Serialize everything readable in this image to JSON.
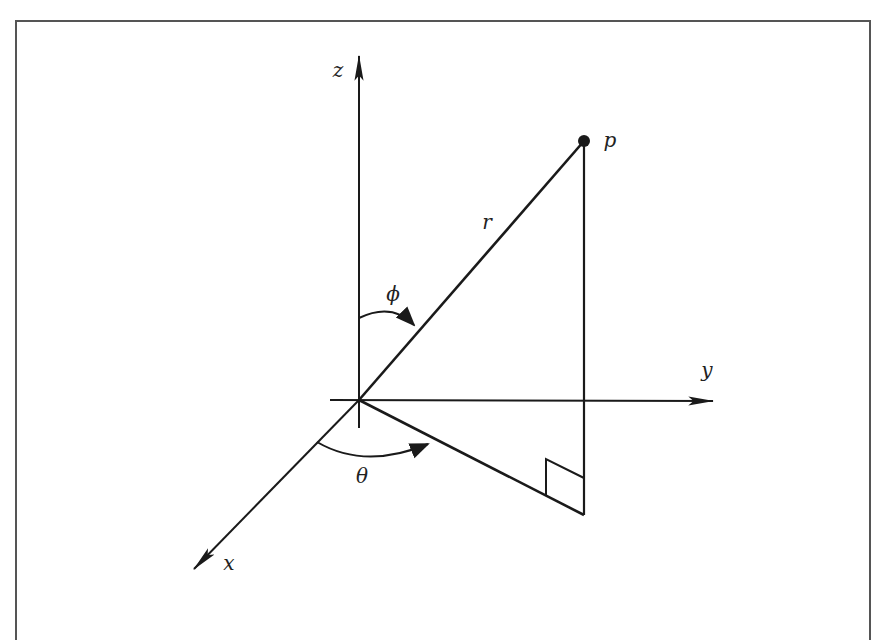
{
  "diagram": {
    "colors": {
      "stroke": "#1a1a1a",
      "frame": "#555555",
      "background": "#ffffff"
    },
    "origin": [
      359,
      400
    ],
    "axes": [
      {
        "id": "z",
        "label": "z",
        "from": [
          359,
          428
        ],
        "to": [
          359,
          55
        ],
        "label_pos": [
          338,
          70
        ]
      },
      {
        "id": "y",
        "label": "y",
        "from": [
          330,
          400
        ],
        "to": [
          714,
          401
        ],
        "label_pos": [
          707,
          370
        ]
      },
      {
        "id": "x",
        "label": "x",
        "from": [
          359,
          400
        ],
        "to": [
          193,
          570
        ],
        "label_pos": [
          229,
          563
        ]
      }
    ],
    "point": {
      "label": "p",
      "pos": [
        584,
        141
      ],
      "label_pos": [
        610,
        140
      ]
    },
    "segments": {
      "radius": {
        "label": "r",
        "from": [
          359,
          400
        ],
        "to": [
          584,
          141
        ],
        "label_pos": [
          487,
          222
        ]
      },
      "vertical_drop": {
        "from": [
          584,
          141
        ],
        "to": [
          584,
          515
        ]
      },
      "projection": {
        "from": [
          359,
          400
        ],
        "to": [
          584,
          515
        ]
      }
    },
    "angles": [
      {
        "id": "phi",
        "label": "ϕ",
        "description": "polar angle from z-axis to r",
        "label_pos": [
          393,
          294
        ]
      },
      {
        "id": "theta",
        "label": "θ",
        "description": "azimuthal angle from x-axis to projection",
        "label_pos": [
          362,
          476
        ]
      }
    ],
    "right_angle_marker": {
      "at": [
        584,
        515
      ]
    }
  }
}
